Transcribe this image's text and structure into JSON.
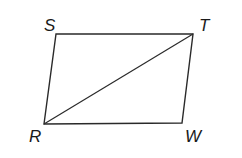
{
  "diagram": {
    "type": "parallelogram",
    "vertices": {
      "S": {
        "label": "S",
        "x": 56,
        "y": 34
      },
      "T": {
        "label": "T",
        "x": 193,
        "y": 34
      },
      "W": {
        "label": "W",
        "x": 182,
        "y": 123
      },
      "R": {
        "label": "R",
        "x": 44,
        "y": 124
      }
    },
    "segments": [
      "ST",
      "TW",
      "WR",
      "RS",
      "RT"
    ],
    "diagonal": "RT",
    "stroke_color": "#2a2a2a"
  }
}
